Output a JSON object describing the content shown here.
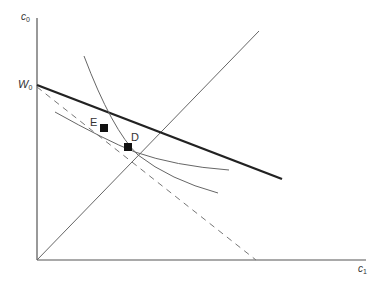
{
  "diagram": {
    "axes": {
      "y_label": "c",
      "y_label_sub": "0",
      "x_label": "c",
      "x_label_sub": "1",
      "intercept_label": "W",
      "intercept_label_sub": "0"
    },
    "points": [
      {
        "label": "E"
      },
      {
        "label": "D"
      }
    ],
    "lines": {
      "budget_line": "solid thick",
      "dashed_line": "dashed",
      "ray_45": "solid thin",
      "indifference_curves": 2
    },
    "colors": {
      "axis": "#555555",
      "budget": "#222222",
      "curve": "#666666",
      "point": "#111111"
    }
  }
}
